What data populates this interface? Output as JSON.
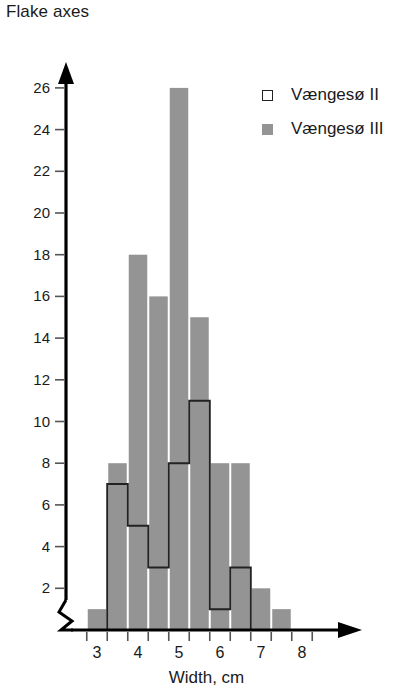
{
  "title": "Flake axes",
  "axes": {
    "x_label": "Width, cm",
    "x_ticks": [
      "3",
      "4",
      "5",
      "6",
      "7",
      "8"
    ],
    "y_ticks": [
      "26",
      "24",
      "22",
      "20",
      "18",
      "16",
      "14",
      "12",
      "10",
      "8",
      "6",
      "4",
      "2"
    ]
  },
  "legend": {
    "items": [
      {
        "label": "Vængesø II",
        "swatch": "open-square",
        "color": "#ffffff"
      },
      {
        "label": "Vængesø III",
        "swatch": "filled-square",
        "color": "#949494"
      }
    ]
  },
  "colors": {
    "gray_fill": "#949494",
    "outline": "#222222",
    "axis": "#000000",
    "background": "#ffffff"
  },
  "chart_data": {
    "type": "bar",
    "title": "Flake axes",
    "xlabel": "Width, cm",
    "ylabel": "",
    "xlim": [
      2.6,
      8.6
    ],
    "ylim": [
      0,
      27
    ],
    "grid": false,
    "legend_position": "top-right",
    "bin_width": 0.5,
    "bin_left_edges": [
      2.75,
      3.25,
      3.75,
      4.25,
      4.75,
      5.25,
      5.75,
      6.25,
      6.75,
      7.25
    ],
    "bin_centers": [
      3.0,
      3.5,
      4.0,
      4.5,
      5.0,
      5.5,
      6.0,
      6.5,
      7.0,
      7.5
    ],
    "categories": [
      "2.75-3.25",
      "3.25-3.75",
      "3.75-4.25",
      "4.25-4.75",
      "4.75-5.25",
      "5.25-5.75",
      "5.75-6.25",
      "6.25-6.75",
      "6.75-7.25",
      "7.25-7.75"
    ],
    "series": [
      {
        "name": "Vængesø II",
        "style": "outlined",
        "color": "#ffffff",
        "edge_color": "#222222",
        "values": [
          0,
          7,
          5,
          3,
          8,
          11,
          1,
          3,
          0,
          0
        ]
      },
      {
        "name": "Vængesø III",
        "style": "filled",
        "color": "#949494",
        "edge_color": "#949494",
        "values": [
          1,
          8,
          18,
          16,
          26,
          15,
          8,
          8,
          2,
          1
        ]
      }
    ]
  }
}
